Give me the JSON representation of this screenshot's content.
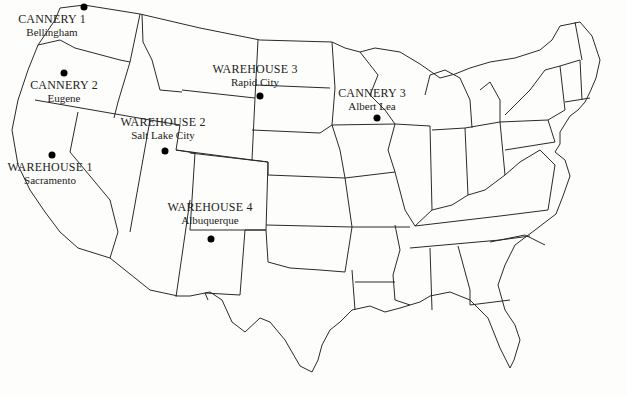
{
  "map": {
    "title": "",
    "region": "Contiguous United States",
    "style": {
      "outline_color": "#2a2a2a",
      "dot_color": "#000000",
      "background": "#fdfdfb"
    }
  },
  "locations": [
    {
      "id": "cannery-1",
      "name": "CANNERY 1",
      "city": "Bellingham",
      "type": "cannery",
      "dot": [
        84,
        7
      ],
      "label": [
        52,
        18
      ]
    },
    {
      "id": "cannery-2",
      "name": "CANNERY 2",
      "city": "Eugene",
      "type": "cannery",
      "dot": [
        64,
        73
      ],
      "label": [
        64,
        82
      ]
    },
    {
      "id": "warehouse-1",
      "name": "WAREHOUSE 1",
      "city": "Sacramento",
      "type": "warehouse",
      "dot": [
        52,
        155
      ],
      "label": [
        50,
        164
      ]
    },
    {
      "id": "warehouse-2",
      "name": "WAREHOUSE 2",
      "city": "Salt Lake City",
      "type": "warehouse",
      "dot": [
        165,
        151
      ],
      "label": [
        163,
        119
      ]
    },
    {
      "id": "warehouse-3",
      "name": "WAREHOUSE 3",
      "city": "Rapid City",
      "type": "warehouse",
      "dot": [
        260,
        96
      ],
      "label": [
        255,
        66
      ]
    },
    {
      "id": "cannery-3",
      "name": "CANNERY 3",
      "city": "Albert Lea",
      "type": "cannery",
      "dot": [
        377,
        118
      ],
      "label": [
        372,
        89
      ]
    },
    {
      "id": "warehouse-4",
      "name": "WAREHOUSE 4",
      "city": "Albuquerque",
      "type": "warehouse",
      "dot": [
        211,
        239
      ],
      "label": [
        210,
        204
      ]
    }
  ]
}
